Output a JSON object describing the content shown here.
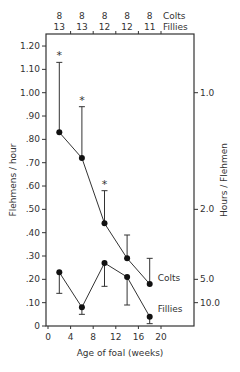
{
  "chart_data": {
    "type": "line",
    "title": "",
    "xlabel": "Age of foal (weeks)",
    "ylabel": "Flehmens / hour",
    "ylabel_right": "Hours / Flehmen",
    "x": [
      2,
      6,
      10,
      14,
      18
    ],
    "xticks": [
      "0",
      "4",
      "8",
      "12",
      "16",
      "20"
    ],
    "xlim": [
      0,
      26
    ],
    "yticks": [
      "0",
      ".10",
      ".20",
      ".30",
      ".40",
      ".50",
      ".60",
      ".70",
      ".80",
      ".90",
      "1.00",
      "1.10",
      "1.20"
    ],
    "ylim": [
      0,
      1.25
    ],
    "yticks_right": [
      {
        "label": "1.0",
        "value": 1.0
      },
      {
        "label": "2.0",
        "value": 0.5
      },
      {
        "label": "5.0",
        "value": 0.2
      },
      {
        "label": "10.0",
        "value": 0.1
      }
    ],
    "top_axis": {
      "colts_n": [
        "8",
        "8",
        "8",
        "8",
        "8"
      ],
      "fillies_n": [
        "13",
        "13",
        "12",
        "12",
        "11"
      ],
      "colts_label": "Colts",
      "fillies_label": "Fillies"
    },
    "series": [
      {
        "name": "Colts",
        "values": [
          0.83,
          0.72,
          0.44,
          0.29,
          0.18
        ],
        "error_upper": [
          1.13,
          0.94,
          0.58,
          0.39,
          0.29
        ],
        "significant": [
          true,
          true,
          true,
          false,
          false
        ]
      },
      {
        "name": "Fillies",
        "values": [
          0.23,
          0.08,
          0.27,
          0.21,
          0.04
        ],
        "error_lower": [
          0.14,
          0.05,
          0.17,
          0.09,
          0.01
        ],
        "significant": [
          false,
          false,
          false,
          false,
          false
        ]
      }
    ],
    "annotations": [
      "*",
      "*",
      "*"
    ],
    "grid": false,
    "legend": "inline labels at series ends"
  }
}
